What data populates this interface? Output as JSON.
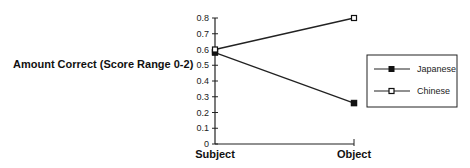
{
  "chart_data": {
    "type": "line",
    "title": "",
    "xlabel": "",
    "ylabel": "Amount Correct (Score Range 0-2)",
    "categories": [
      "Subject",
      "Object"
    ],
    "series": [
      {
        "name": "Japanese",
        "marker": "filled-square",
        "values": [
          0.58,
          0.26
        ]
      },
      {
        "name": "Chinese",
        "marker": "open-square",
        "values": [
          0.6,
          0.8
        ]
      }
    ],
    "ylim": [
      0,
      0.8
    ],
    "yticks": [
      "0",
      "0.1",
      "0.2",
      "0.3",
      "0.4",
      "0.5",
      "0.6",
      "0.7",
      "0.8"
    ],
    "grid": false,
    "legend_position": "right"
  }
}
